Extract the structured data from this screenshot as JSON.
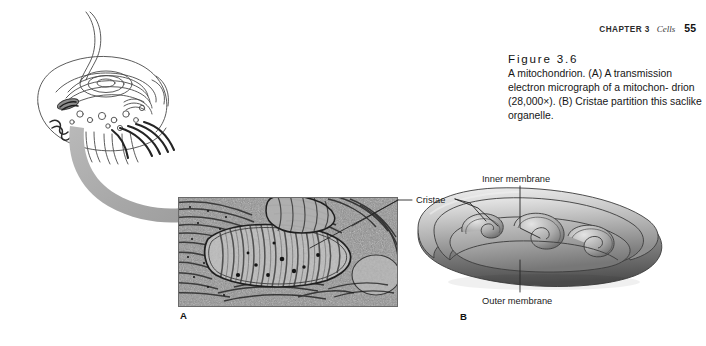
{
  "page": {
    "width": 706,
    "height": 346,
    "background": "#ffffff"
  },
  "running_head": {
    "chapter": "CHAPTER 3",
    "section": "Cells",
    "page_number": "55"
  },
  "caption": {
    "figure_number": "Figure 3.6",
    "text": "A mitochondrion. (A) A transmission electron micrograph of a mitochondrion (28,000×). (B) Cristae partition this saclike organelle.",
    "line1": "A mitochondrion. (A) A transmission",
    "line2": "electron micrograph of a mitochon-",
    "line3": "drion (28,000×). (B) Cristae partition",
    "line4": "this saclike organelle.",
    "magnification": "28,000×"
  },
  "panels": [
    {
      "id": "A",
      "label": "A",
      "type": "electron-micrograph",
      "description": "Transmission electron micrograph of a mitochondrion showing cristae, surrounded by rough endoplasmic reticulum",
      "x": 178,
      "y": 197,
      "width": 220,
      "height": 110
    },
    {
      "id": "B",
      "label": "B",
      "type": "cutaway-illustration",
      "description": "Three-dimensional cutaway drawing of a mitochondrion showing inner and outer membranes and cristae",
      "x": 404,
      "y": 170,
      "width": 296,
      "height": 140
    }
  ],
  "diagram_labels": [
    {
      "name": "cristae",
      "text": "Cristae"
    },
    {
      "name": "inner-membrane",
      "text": "Inner membrane"
    },
    {
      "name": "outer-membrane",
      "text": "Outer membrane"
    }
  ],
  "cell_overview": {
    "name": "eukaryotic-cell-cutaway",
    "description": "Line drawing of a eukaryotic cell cutaway with flagellum, nucleus, endoplasmic reticulum and mitochondria"
  },
  "pointer_arrow": {
    "name": "zoom-pointer-arrow",
    "description": "Thick curved gray arrow pointing from the cell drawing to the micrograph",
    "color": "#a9a9a9"
  },
  "colors": {
    "text": "#161616",
    "arrow_gray": "#a9a9a9",
    "leader_line": "#2a2a2a",
    "membrane_light": "#e8e8e8",
    "membrane_mid": "#9a9a9a",
    "membrane_dark": "#4f4f4f"
  }
}
